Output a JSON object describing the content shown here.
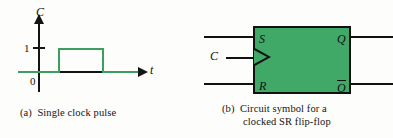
{
  "figure": {
    "background_color": "#fdfdfb",
    "ink_color": "#141414",
    "accent_green_fill": "#41a967",
    "accent_green_line": "#3c9e5f"
  },
  "panel_a": {
    "caption": "(a)  Single clock pulse",
    "y_axis_label": "C",
    "x_axis_label": "t",
    "tick_label_high": "1",
    "tick_label_low": "0",
    "chart_data": {
      "type": "line",
      "title": "Single clock pulse",
      "xlabel": "t",
      "ylabel": "C",
      "x": [
        0,
        1.2,
        1.2,
        3.0,
        3.0,
        4.4
      ],
      "values": [
        0,
        0,
        1,
        1,
        0,
        0
      ],
      "ytick_labels": [
        "0",
        "1"
      ],
      "ytick_values": [
        0,
        1
      ],
      "ylim": [
        0,
        1.35
      ],
      "xlim": [
        0,
        5
      ],
      "grid": false,
      "legend": false,
      "series_color": "#3c9e5f"
    }
  },
  "panel_b": {
    "caption_line1": "(b)  Circuit symbol for a",
    "caption_line2": "clocked SR flip-flop",
    "block_fill_color": "#41a967",
    "input_label_clock": "C",
    "pins": {
      "set": "S",
      "reset": "R",
      "output": "Q",
      "output_inverted": "Q"
    },
    "clock_edge_marker": "dynamic-input-triangle"
  }
}
